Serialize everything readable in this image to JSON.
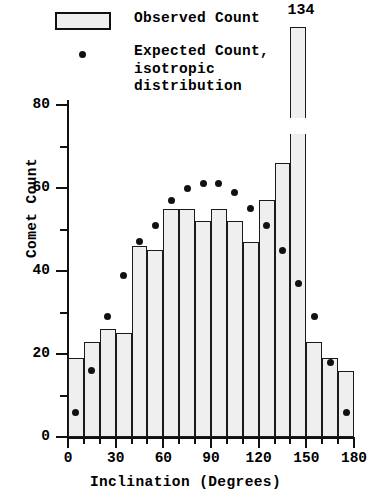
{
  "legend": {
    "observed_label": "Observed Count",
    "expected_label": "Expected Count,\nisotropic\ndistribution",
    "swatch_name": "observed-bar-swatch",
    "dot_name": "expected-dot-swatch"
  },
  "axes": {
    "x_title": "Inclination  (Degrees)",
    "y_title": "Comet Count",
    "x_major_labels": [
      "0",
      "30",
      "60",
      "90",
      "120",
      "150",
      "180"
    ],
    "y_major_labels": [
      "0",
      "20",
      "40",
      "60",
      "80"
    ]
  },
  "annotations": {
    "peak_value_label": "134"
  },
  "colors": {
    "bar_fill": "#efefef",
    "bar_stroke": "#1a1a1a",
    "dot": "#111111",
    "axis": "#111111",
    "background": "#ffffff"
  },
  "chart_data": {
    "type": "bar",
    "title": "",
    "xlabel": "Inclination  (Degrees)",
    "ylabel": "Comet Count",
    "xlim": [
      0,
      180
    ],
    "ylim": [
      0,
      80
    ],
    "y_axis_break": {
      "from": 83,
      "to": 126,
      "note": "bar clipped; true value annotated"
    },
    "bin_width": 10,
    "grid": false,
    "legend_position": "top-left",
    "categories": [
      "0-10",
      "10-20",
      "20-30",
      "30-40",
      "40-50",
      "50-60",
      "60-70",
      "70-80",
      "80-90",
      "90-100",
      "100-110",
      "110-120",
      "120-130",
      "130-140",
      "140-150",
      "150-160",
      "160-170",
      "170-180"
    ],
    "bin_centers": [
      5,
      15,
      25,
      35,
      45,
      55,
      65,
      75,
      85,
      95,
      105,
      115,
      125,
      135,
      145,
      155,
      165,
      175
    ],
    "series": [
      {
        "name": "Observed Count",
        "type": "bar",
        "values": [
          19,
          23,
          26,
          25,
          46,
          45,
          55,
          55,
          52,
          55,
          52,
          47,
          57,
          66,
          134,
          23,
          19,
          16
        ]
      },
      {
        "name": "Expected Count, isotropic distribution",
        "type": "scatter",
        "values": [
          6,
          16,
          29,
          39,
          47,
          51,
          57,
          60,
          61,
          61,
          59,
          55,
          51,
          45,
          37,
          29,
          18,
          6
        ]
      }
    ],
    "annotations": [
      {
        "text": "134",
        "bin": "140-150",
        "value": 134
      }
    ]
  }
}
